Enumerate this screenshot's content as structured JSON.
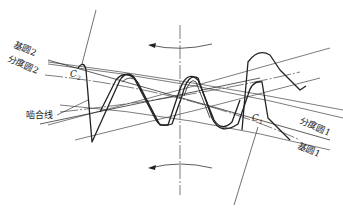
{
  "diagram": {
    "type": "gear-meshing",
    "labels": {
      "base_circle_2": "基圆2",
      "pitch_circle_2": "分度圆2",
      "line_of_action": "啮合线",
      "pitch_circle_1": "分度圆1",
      "base_circle_1": "基圆1",
      "point_c2": "C",
      "point_c2_sub": "2",
      "point_c1": "C",
      "point_c1_sub": "1"
    },
    "rotation_arrows": [
      {
        "position": "top",
        "direction": "counterclockwise-left"
      },
      {
        "position": "bottom",
        "direction": "left"
      }
    ],
    "colors": {
      "line": "#222222",
      "thin_line": "#444444",
      "background": "#ffffff"
    }
  }
}
